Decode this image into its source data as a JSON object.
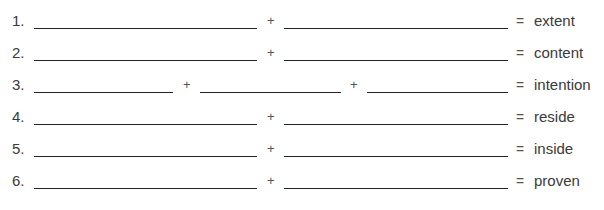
{
  "exercise": {
    "rows": [
      {
        "number": "1.",
        "operators": [
          "+"
        ],
        "equals": "=",
        "result": "extent"
      },
      {
        "number": "2.",
        "operators": [
          "+"
        ],
        "equals": "=",
        "result": "content"
      },
      {
        "number": "3.",
        "operators": [
          "+",
          "+"
        ],
        "equals": "=",
        "result": "intention"
      },
      {
        "number": "4.",
        "operators": [
          "+"
        ],
        "equals": "=",
        "result": "reside"
      },
      {
        "number": "5.",
        "operators": [
          "+"
        ],
        "equals": "=",
        "result": "inside"
      },
      {
        "number": "6.",
        "operators": [
          "+"
        ],
        "equals": "=",
        "result": "proven"
      }
    ]
  }
}
